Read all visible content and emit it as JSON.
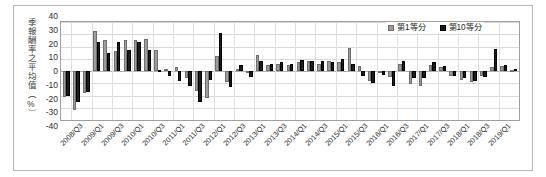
{
  "chart_data": {
    "type": "bar",
    "title": "",
    "xlabel": "",
    "ylabel": "季報酬率之平均值（%）",
    "ylim": [
      -40,
      40
    ],
    "ytick_labels": [
      "40",
      "30",
      "20",
      "10",
      "0",
      "-10",
      "-20",
      "-30",
      "-40"
    ],
    "ytick_values": [
      40,
      30,
      20,
      10,
      0,
      -10,
      -20,
      -30,
      -40
    ],
    "grid": true,
    "legend_position": "top-right",
    "legend": [
      "第1等分",
      "第10等分"
    ],
    "colors": {
      "series_1": "#9d9d9d",
      "series_10": "#1c1c1c",
      "gridline": "#d9d9d9",
      "axis": "#9e9e9e",
      "frame": "#b7b7b7"
    },
    "categories": [
      "2008/Q2",
      "2008/Q3",
      "2008/Q4",
      "2009/Q1",
      "2009/Q2",
      "2009/Q3",
      "2009/Q4",
      "2010/Q1",
      "2010/Q2",
      "2010/Q3",
      "2010/Q4",
      "2011/Q1",
      "2011/Q2",
      "2011/Q3",
      "2011/Q4",
      "2012/Q1",
      "2012/Q2",
      "2012/Q3",
      "2012/Q4",
      "2013/Q1",
      "2013/Q2",
      "2013/Q3",
      "2013/Q4",
      "2014/Q1",
      "2014/Q2",
      "2014/Q3",
      "2014/Q4",
      "2015/Q1",
      "2015/Q2",
      "2015/Q3",
      "2015/Q4",
      "2016/Q1",
      "2016/Q2",
      "2016/Q3",
      "2016/Q4",
      "2017/Q1",
      "2017/Q2",
      "2017/Q3",
      "2017/Q4",
      "2018/Q1",
      "2018/Q2",
      "2018/Q3",
      "2018/Q4",
      "2019/Q1",
      "2019/Q2"
    ],
    "xtick_labels": [
      "2008/Q3",
      "2009/Q1",
      "2009/Q3",
      "2010/Q1",
      "2010/Q3",
      "2011/Q1",
      "2011/Q3",
      "2012/Q1",
      "2012/Q3",
      "2013/Q1",
      "2013/Q3",
      "2014/Q1",
      "2014/Q3",
      "2015/Q1",
      "2015/Q3",
      "2016/Q1",
      "2016/Q3",
      "2017/Q1",
      "2017/Q3",
      "2018/Q1",
      "2018/Q3",
      "2019/Q1"
    ],
    "xtick_indices": [
      1,
      3,
      5,
      7,
      9,
      11,
      13,
      15,
      17,
      19,
      21,
      23,
      25,
      27,
      29,
      31,
      33,
      35,
      37,
      39,
      41,
      43
    ],
    "series": [
      {
        "name": "第1等分",
        "color": "#9d9d9d",
        "values": [
          -21,
          -32,
          -18,
          33,
          25,
          16,
          25,
          25,
          26,
          17,
          2,
          3,
          -6,
          -16,
          -22,
          12,
          -9,
          2,
          -1,
          13,
          5,
          6,
          5,
          7,
          8,
          6,
          8,
          7,
          19,
          4,
          -8,
          -2,
          -5,
          6,
          -11,
          -12,
          5,
          3,
          -4,
          -7,
          -9,
          -4,
          3,
          4,
          1
        ]
      },
      {
        "name": "第10等分",
        "color": "#1c1c1c",
        "values": [
          -20,
          -25,
          -17,
          24,
          15,
          24,
          17,
          24,
          17,
          1,
          -4,
          -8,
          -12,
          -25,
          -7,
          31,
          -13,
          5,
          -5,
          8,
          6,
          7,
          6,
          9,
          8,
          8,
          7,
          10,
          6,
          -4,
          -10,
          -3,
          -12,
          8,
          -6,
          -6,
          7,
          4,
          -4,
          -6,
          -8,
          -5,
          18,
          5,
          2
        ]
      }
    ]
  }
}
